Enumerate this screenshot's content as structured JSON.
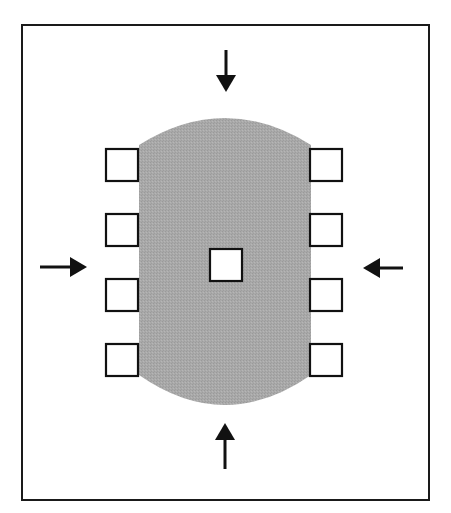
{
  "diagram": {
    "colors": {
      "background": "#ffffff",
      "frame": "#1a1a1a",
      "body_fill": "#a8a8a8",
      "square_fill": "#ffffff",
      "square_stroke": "#111111",
      "arrow": "#111111"
    },
    "frame": {
      "x": 22,
      "y": 25,
      "width": 407,
      "height": 475
    },
    "body": {
      "shape": "stadium-with-arcs",
      "left": 139,
      "right": 311,
      "top_arc_peak": 118,
      "side_top": 145,
      "side_bottom": 375,
      "bottom_arc_peak": 405
    },
    "squares": {
      "size": 32,
      "left_column": [
        {
          "x": 106,
          "y": 149
        },
        {
          "x": 106,
          "y": 214
        },
        {
          "x": 106,
          "y": 279
        },
        {
          "x": 106,
          "y": 344
        }
      ],
      "right_column": [
        {
          "x": 310,
          "y": 149
        },
        {
          "x": 310,
          "y": 214
        },
        {
          "x": 310,
          "y": 279
        },
        {
          "x": 310,
          "y": 344
        }
      ],
      "center": {
        "x": 210,
        "y": 249
      }
    },
    "arrows": [
      {
        "id": "top",
        "direction": "down",
        "x1": 226,
        "y1": 50,
        "x2": 226,
        "y2": 92
      },
      {
        "id": "bottom",
        "direction": "up",
        "x1": 225,
        "y1": 469,
        "x2": 225,
        "y2": 423
      },
      {
        "id": "left",
        "direction": "right",
        "x1": 40,
        "y1": 267,
        "x2": 87,
        "y2": 267
      },
      {
        "id": "right",
        "direction": "left",
        "x1": 403,
        "y1": 268,
        "x2": 363,
        "y2": 268
      }
    ]
  }
}
